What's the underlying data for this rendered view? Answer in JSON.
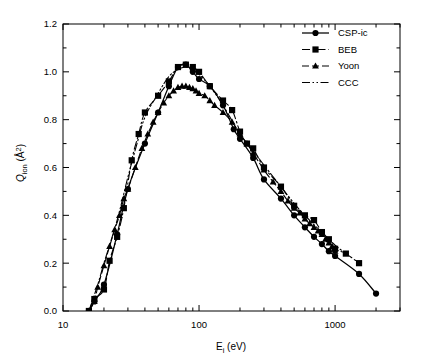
{
  "figure": {
    "background_color": "#ffffff",
    "ink_color": "#000000"
  },
  "axes": {
    "x": {
      "label_main": "E",
      "label_sub": "i",
      "label_unit": "(eV)",
      "label_full": "E_i (eV)",
      "scale": "log",
      "min": 10,
      "max": 3000,
      "tick_labels": [
        "10",
        "100",
        "1000"
      ],
      "tick_values": [
        10,
        100,
        1000
      ]
    },
    "y": {
      "label_main": "Q",
      "label_sub": "ion",
      "label_unit": "(Å2)",
      "label_full": "Q_ion (Å²)",
      "scale": "linear",
      "min": 0.0,
      "max": 1.2,
      "tick_labels": [
        "0.0",
        "0.2",
        "0.4",
        "0.6",
        "0.8",
        "1.0",
        "1.2"
      ],
      "tick_values": [
        0.0,
        0.2,
        0.4,
        0.6,
        0.8,
        1.0,
        1.2
      ],
      "minor_step": 0.1
    }
  },
  "legend": {
    "position": "top-right",
    "border": false,
    "items": [
      {
        "label": "CSP-ic",
        "marker": "circle",
        "line_style": "solid"
      },
      {
        "label": "BEB",
        "marker": "square",
        "line_style": "dash-dot"
      },
      {
        "label": "Yoon",
        "marker": "triangle",
        "line_style": "dashed"
      },
      {
        "label": "CCC",
        "marker": "none",
        "line_style": "dash-dot-dot"
      }
    ]
  },
  "chart_data": {
    "type": "line",
    "title": "",
    "subtitle": "",
    "xlabel": "E_i (eV)",
    "ylabel": "Q_ion (Å²)",
    "xscale": "log",
    "yscale": "linear",
    "xlim": [
      10,
      3000
    ],
    "ylim": [
      0.0,
      1.2
    ],
    "grid": false,
    "legend_position": "top-right",
    "series": [
      {
        "name": "CSP-ic",
        "marker": "circle",
        "line_style": "solid",
        "x": [
          15.5,
          17,
          20,
          25,
          30,
          40,
          50,
          60,
          70,
          80,
          90,
          100,
          120,
          150,
          180,
          200,
          250,
          300,
          400,
          500,
          600,
          700,
          800,
          900,
          1000,
          1500,
          2000
        ],
        "y": [
          0.0,
          0.04,
          0.11,
          0.32,
          0.51,
          0.7,
          0.83,
          0.94,
          1.02,
          1.03,
          1.0,
          0.97,
          0.94,
          0.86,
          0.76,
          0.72,
          0.64,
          0.55,
          0.47,
          0.4,
          0.35,
          0.31,
          0.28,
          0.25,
          0.23,
          0.155,
          0.073
        ]
      },
      {
        "name": "BEB",
        "marker": "square",
        "line_style": "dash-dot",
        "x": [
          15.5,
          17,
          20,
          22,
          25,
          28,
          32,
          36,
          40,
          50,
          60,
          70,
          80,
          90,
          100,
          120,
          150,
          175,
          200,
          225,
          250,
          300,
          400,
          500,
          600,
          700,
          800,
          900,
          1000,
          1200,
          1500
        ],
        "y": [
          0.0,
          0.05,
          0.09,
          0.21,
          0.31,
          0.43,
          0.63,
          0.74,
          0.83,
          0.9,
          0.96,
          1.02,
          1.03,
          1.02,
          1.0,
          0.94,
          0.88,
          0.84,
          0.75,
          0.7,
          0.68,
          0.6,
          0.52,
          0.44,
          0.4,
          0.38,
          0.33,
          0.3,
          0.26,
          0.24,
          0.2
        ]
      },
      {
        "name": "Yoon",
        "marker": "triangle",
        "line_style": "dashed",
        "x": [
          15.5,
          17,
          18,
          20,
          22,
          24,
          26,
          28,
          30,
          34,
          38,
          42,
          46,
          50,
          55,
          60,
          65,
          70,
          75,
          80,
          85,
          90,
          95,
          100,
          110,
          120,
          130,
          150,
          175,
          200,
          225,
          250,
          300,
          350,
          400,
          450,
          500,
          550,
          600,
          650,
          700,
          750,
          800,
          850,
          900,
          950,
          1000
        ],
        "y": [
          0.0,
          0.04,
          0.1,
          0.19,
          0.27,
          0.34,
          0.4,
          0.47,
          0.51,
          0.6,
          0.68,
          0.74,
          0.79,
          0.83,
          0.87,
          0.9,
          0.92,
          0.935,
          0.94,
          0.94,
          0.935,
          0.93,
          0.92,
          0.91,
          0.9,
          0.88,
          0.86,
          0.83,
          0.79,
          0.74,
          0.7,
          0.66,
          0.59,
          0.54,
          0.5,
          0.46,
          0.43,
          0.41,
          0.385,
          0.365,
          0.35,
          0.335,
          0.32,
          0.3,
          0.285,
          0.27,
          0.25
        ]
      },
      {
        "name": "CCC",
        "marker": "none",
        "line_style": "dash-dot-dot",
        "x": [
          15.5,
          18,
          20,
          25,
          30,
          35,
          40,
          50,
          60,
          70,
          80,
          90,
          100,
          120,
          150,
          200,
          250,
          300,
          400,
          500,
          600,
          700,
          800,
          900,
          1000,
          1200
        ],
        "y": [
          0.0,
          0.11,
          0.2,
          0.38,
          0.56,
          0.7,
          0.81,
          0.91,
          0.98,
          1.01,
          1.02,
          1.01,
          0.99,
          0.94,
          0.86,
          0.74,
          0.67,
          0.61,
          0.52,
          0.45,
          0.4,
          0.36,
          0.33,
          0.3,
          0.275,
          0.24
        ]
      }
    ]
  }
}
